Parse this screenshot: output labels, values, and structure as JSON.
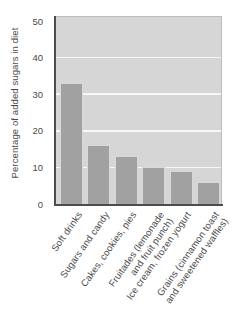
{
  "chart_data": {
    "type": "bar",
    "title": "",
    "ylabel": "Percentage of added sugars in diet",
    "xlabel": "",
    "categories": [
      "Soft drinks",
      "Sugars and candy",
      "Cakes, cookies, pies",
      "Fruitades (lemonade\nand fruit punch)",
      "Ice cream, frozen yogurt",
      "Grains (cinnamon toast\nand sweetened waffles)"
    ],
    "values": [
      33,
      16,
      13,
      10,
      9,
      6
    ],
    "ylim": [
      0,
      50
    ],
    "yticks": [
      0,
      10,
      20,
      30,
      40,
      50
    ],
    "gridline_values": [
      10,
      20,
      30,
      40
    ],
    "grid": true,
    "legend": "none",
    "colors": {
      "bar": "#a1a1a1",
      "plot_background": "#d6d6d6",
      "gridline": "#f7f7f7",
      "axis": "#4c4c4c",
      "text": "#4a4a4a",
      "plot_border": "#bdbdbd",
      "page_background": "#ffffff"
    }
  }
}
